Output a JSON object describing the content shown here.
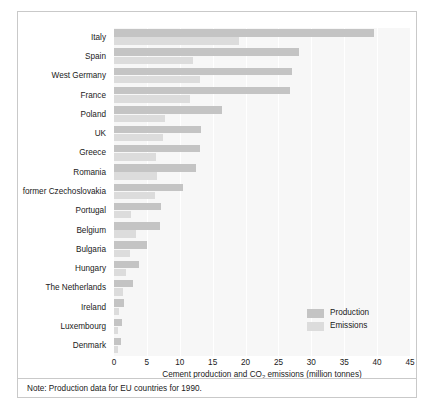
{
  "chart_data": {
    "type": "bar",
    "orientation": "horizontal",
    "title": "",
    "xlabel": "Cement production and CO2 emissions (million tonnes)",
    "ylabel": "",
    "xlim": [
      0,
      45
    ],
    "xticks": [
      0,
      5,
      10,
      15,
      20,
      25,
      30,
      35,
      40,
      45
    ],
    "grid": true,
    "grid_axis": "x",
    "legend_position": "inside-lower-right",
    "categories": [
      "Italy",
      "Spain",
      "West Germany",
      "France",
      "Poland",
      "UK",
      "Greece",
      "Romania",
      "former Czechoslovakia",
      "Portugal",
      "Belgium",
      "Bulgaria",
      "Hungary",
      "The Netherlands",
      "Ireland",
      "Luxembourg",
      "Denmark"
    ],
    "series": [
      {
        "name": "Production",
        "color": "#c4c4c4",
        "values": [
          39.5,
          28.2,
          27.0,
          26.8,
          16.4,
          13.2,
          13.0,
          12.4,
          10.5,
          7.2,
          7.0,
          5.0,
          3.8,
          2.9,
          1.5,
          1.2,
          1.1
        ]
      },
      {
        "name": "Emissions",
        "color": "#dcdcdc",
        "values": [
          19.0,
          12.0,
          13.0,
          11.5,
          7.7,
          7.4,
          6.4,
          6.5,
          6.2,
          2.6,
          3.4,
          2.4,
          1.8,
          1.4,
          0.8,
          0.6,
          0.6
        ]
      }
    ],
    "note": "Note: Production data for EU countries for 1990."
  },
  "axis": {
    "x_title_main": "Cement production and CO",
    "x_title_sub": "2",
    "x_title_rest": " emissions (million tonnes)"
  },
  "legend": {
    "items": [
      {
        "label": "Production",
        "color": "#c4c4c4"
      },
      {
        "label": "Emissions",
        "color": "#dcdcdc"
      }
    ]
  },
  "note": {
    "text": "Note: Production data for EU countries for 1990."
  }
}
